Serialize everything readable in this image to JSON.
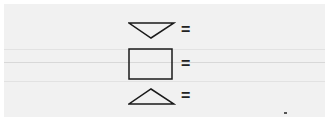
{
  "rows": [
    {
      "shape": "inverted-triangle",
      "label": "="
    },
    {
      "shape": "rectangle",
      "label": "="
    },
    {
      "shape": "triangle",
      "label": "="
    }
  ],
  "colors": {
    "background": "#f1f1f1",
    "stroke": "#1a1a1a"
  }
}
